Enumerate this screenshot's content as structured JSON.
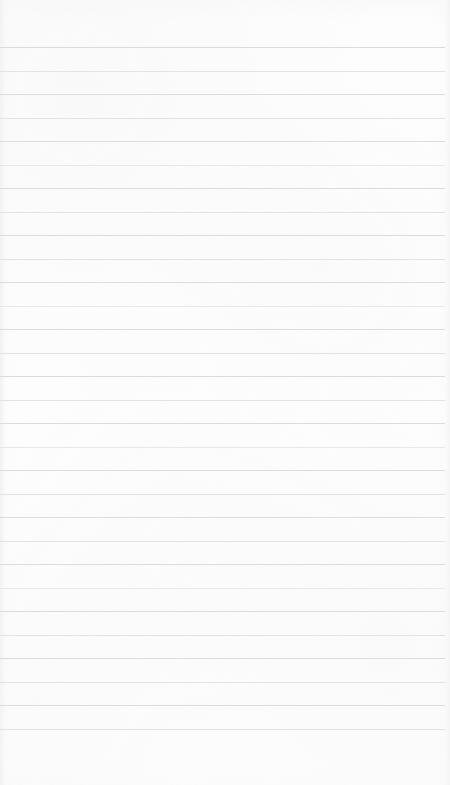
{
  "document": {
    "kind": "ruled-notepad-page",
    "title": "Blank Ruled Paper",
    "page_label": "",
    "content_text": "",
    "placeholder": ""
  },
  "colors": {
    "paper": "#fdfdfd",
    "rule_line": "#d9dadd",
    "rule_line_soft": "#e0e1e4",
    "rule_line_faint": "#e6e7ea",
    "edge_shadow": "#e8e8ea",
    "ink": "#23262b"
  },
  "layout": {
    "page_width": 450,
    "page_height": 785,
    "first_line_y": 47,
    "line_spacing": 23.5,
    "line_count": 30,
    "line_left": 0,
    "line_right_margin": 5,
    "top_margin": 47,
    "bottom_margin": 55
  },
  "rules": [
    {
      "y": 47,
      "weight": "normal"
    },
    {
      "y": 70.5,
      "weight": "soft"
    },
    {
      "y": 94,
      "weight": "normal"
    },
    {
      "y": 117.5,
      "weight": "soft"
    },
    {
      "y": 141,
      "weight": "normal"
    },
    {
      "y": 164.5,
      "weight": "faint"
    },
    {
      "y": 188,
      "weight": "normal"
    },
    {
      "y": 211.5,
      "weight": "soft"
    },
    {
      "y": 235,
      "weight": "normal"
    },
    {
      "y": 258.5,
      "weight": "soft"
    },
    {
      "y": 282,
      "weight": "normal"
    },
    {
      "y": 305.5,
      "weight": "faint"
    },
    {
      "y": 329,
      "weight": "normal"
    },
    {
      "y": 352.5,
      "weight": "soft"
    },
    {
      "y": 376,
      "weight": "normal"
    },
    {
      "y": 399.5,
      "weight": "soft"
    },
    {
      "y": 423,
      "weight": "normal"
    },
    {
      "y": 446.5,
      "weight": "faint"
    },
    {
      "y": 470,
      "weight": "normal"
    },
    {
      "y": 493.5,
      "weight": "soft"
    },
    {
      "y": 517,
      "weight": "normal"
    },
    {
      "y": 540.5,
      "weight": "soft"
    },
    {
      "y": 564,
      "weight": "normal"
    },
    {
      "y": 587.5,
      "weight": "faint"
    },
    {
      "y": 611,
      "weight": "normal"
    },
    {
      "y": 634.5,
      "weight": "soft"
    },
    {
      "y": 658,
      "weight": "normal"
    },
    {
      "y": 681.5,
      "weight": "soft"
    },
    {
      "y": 705,
      "weight": "normal"
    },
    {
      "y": 729,
      "weight": "soft"
    }
  ]
}
